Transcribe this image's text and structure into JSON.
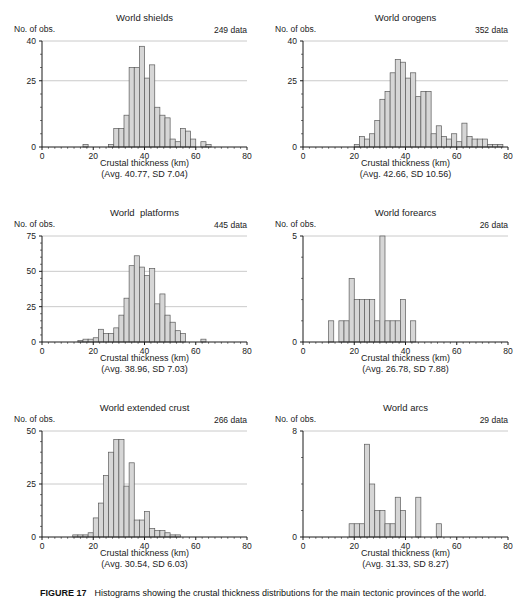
{
  "style": {
    "background": "#ffffff",
    "bar_fill": "#d6d6d6",
    "bar_stroke": "#5a5a5a",
    "grid_color": "#bdbdbd",
    "axis_color": "#1a1a1a",
    "text_color": "#222222"
  },
  "figure": {
    "caption_label": "FIGURE 17",
    "caption_text": "Histograms showing the crustal thickness distributions for the main tectonic provinces of the world."
  },
  "chart_data": [
    {
      "type": "bar",
      "title": "World shields",
      "data_count_label": "249 data",
      "ylabel": "No. of obs.",
      "xlabel": "Crustal thickness (km)",
      "stats_label": "(Avg. 40.77, SD 7.04)",
      "xlim": [
        0,
        80
      ],
      "xticks": [
        0,
        20,
        40,
        60,
        80
      ],
      "x_minor_step": 2.5,
      "ylim": [
        0,
        40
      ],
      "yticks": [
        0,
        25,
        40
      ],
      "y_minor_step": 5,
      "grid": true,
      "bin_width": 2,
      "bars": [
        {
          "start": 16,
          "count": 1
        },
        {
          "start": 26,
          "count": 1
        },
        {
          "start": 28,
          "count": 7
        },
        {
          "start": 30,
          "count": 7
        },
        {
          "start": 32,
          "count": 12
        },
        {
          "start": 34,
          "count": 30
        },
        {
          "start": 36,
          "count": 30
        },
        {
          "start": 38,
          "count": 38
        },
        {
          "start": 40,
          "count": 26
        },
        {
          "start": 42,
          "count": 31
        },
        {
          "start": 44,
          "count": 15
        },
        {
          "start": 46,
          "count": 12
        },
        {
          "start": 48,
          "count": 11
        },
        {
          "start": 50,
          "count": 3
        },
        {
          "start": 52,
          "count": 2
        },
        {
          "start": 54,
          "count": 7
        },
        {
          "start": 56,
          "count": 6
        },
        {
          "start": 58,
          "count": 3
        },
        {
          "start": 62,
          "count": 2
        },
        {
          "start": 64,
          "count": 1
        }
      ]
    },
    {
      "type": "bar",
      "title": "World orogens",
      "data_count_label": "352 data",
      "ylabel": "No. of obs.",
      "xlabel": "Crustal thickness (km)",
      "stats_label": "(Avg. 42.66, SD 10.56)",
      "xlim": [
        0,
        80
      ],
      "xticks": [
        0,
        20,
        40,
        60,
        80
      ],
      "x_minor_step": 2.5,
      "ylim": [
        0,
        40
      ],
      "yticks": [
        0,
        25,
        40
      ],
      "y_minor_step": 5,
      "grid": true,
      "bin_width": 2,
      "bars": [
        {
          "start": 20,
          "count": 1
        },
        {
          "start": 22,
          "count": 4
        },
        {
          "start": 24,
          "count": 3
        },
        {
          "start": 26,
          "count": 5
        },
        {
          "start": 28,
          "count": 10
        },
        {
          "start": 30,
          "count": 18
        },
        {
          "start": 32,
          "count": 21
        },
        {
          "start": 34,
          "count": 28
        },
        {
          "start": 36,
          "count": 33
        },
        {
          "start": 38,
          "count": 32
        },
        {
          "start": 40,
          "count": 26
        },
        {
          "start": 42,
          "count": 28
        },
        {
          "start": 44,
          "count": 19
        },
        {
          "start": 46,
          "count": 21
        },
        {
          "start": 48,
          "count": 21
        },
        {
          "start": 50,
          "count": 5
        },
        {
          "start": 52,
          "count": 8
        },
        {
          "start": 54,
          "count": 4
        },
        {
          "start": 56,
          "count": 3
        },
        {
          "start": 58,
          "count": 5
        },
        {
          "start": 60,
          "count": 2
        },
        {
          "start": 62,
          "count": 9
        },
        {
          "start": 64,
          "count": 4
        },
        {
          "start": 66,
          "count": 3
        },
        {
          "start": 68,
          "count": 3
        },
        {
          "start": 70,
          "count": 3
        },
        {
          "start": 72,
          "count": 1
        },
        {
          "start": 74,
          "count": 1
        },
        {
          "start": 76,
          "count": 1
        }
      ]
    },
    {
      "type": "bar",
      "title": "World  platforms",
      "data_count_label": "445 data",
      "ylabel": "No. of obs.",
      "xlabel": "Crustal thickness (km)",
      "stats_label": "(Avg. 38.96, SD 7.03)",
      "xlim": [
        0,
        80
      ],
      "xticks": [
        0,
        20,
        40,
        60,
        80
      ],
      "x_minor_step": 2.5,
      "ylim": [
        0,
        75
      ],
      "yticks": [
        0,
        25,
        50,
        75
      ],
      "y_minor_step": 5,
      "grid": true,
      "bin_width": 2,
      "bars": [
        {
          "start": 14,
          "count": 1
        },
        {
          "start": 16,
          "count": 2
        },
        {
          "start": 18,
          "count": 2
        },
        {
          "start": 20,
          "count": 3
        },
        {
          "start": 22,
          "count": 9
        },
        {
          "start": 24,
          "count": 6
        },
        {
          "start": 26,
          "count": 6
        },
        {
          "start": 28,
          "count": 10
        },
        {
          "start": 30,
          "count": 19
        },
        {
          "start": 32,
          "count": 31
        },
        {
          "start": 34,
          "count": 54
        },
        {
          "start": 36,
          "count": 61
        },
        {
          "start": 38,
          "count": 53
        },
        {
          "start": 40,
          "count": 47
        },
        {
          "start": 42,
          "count": 52
        },
        {
          "start": 44,
          "count": 27
        },
        {
          "start": 46,
          "count": 34
        },
        {
          "start": 48,
          "count": 19
        },
        {
          "start": 50,
          "count": 14
        },
        {
          "start": 52,
          "count": 8
        },
        {
          "start": 54,
          "count": 6
        },
        {
          "start": 62,
          "count": 2
        }
      ]
    },
    {
      "type": "bar",
      "title": "World forearcs",
      "data_count_label": "26 data",
      "ylabel": "No. of obs.",
      "xlabel": "Crustal thickness (km)",
      "stats_label": "(Avg. 26.78, SD 7.88)",
      "xlim": [
        0,
        80
      ],
      "xticks": [
        0,
        20,
        40,
        60,
        80
      ],
      "x_minor_step": 2.5,
      "ylim": [
        0,
        5
      ],
      "yticks": [
        0,
        5
      ],
      "y_minor_step": 1,
      "grid": true,
      "bin_width": 2,
      "bars": [
        {
          "start": 10,
          "count": 1
        },
        {
          "start": 14,
          "count": 1
        },
        {
          "start": 16,
          "count": 1
        },
        {
          "start": 18,
          "count": 3
        },
        {
          "start": 20,
          "count": 2
        },
        {
          "start": 22,
          "count": 2
        },
        {
          "start": 24,
          "count": 2
        },
        {
          "start": 26,
          "count": 2
        },
        {
          "start": 28,
          "count": 1
        },
        {
          "start": 30,
          "count": 5
        },
        {
          "start": 32,
          "count": 1
        },
        {
          "start": 34,
          "count": 1
        },
        {
          "start": 36,
          "count": 1
        },
        {
          "start": 38,
          "count": 2
        },
        {
          "start": 42,
          "count": 1
        }
      ]
    },
    {
      "type": "bar",
      "title": "World extended crust",
      "data_count_label": "266 data",
      "ylabel": "No. of obs.",
      "xlabel": "Crustal thickness (km)",
      "stats_label": "(Avg. 30.54, SD 6.03)",
      "xlim": [
        0,
        80
      ],
      "xticks": [
        0,
        20,
        40,
        60,
        80
      ],
      "x_minor_step": 2.5,
      "ylim": [
        0,
        50
      ],
      "yticks": [
        0,
        25,
        50
      ],
      "y_minor_step": 5,
      "grid": true,
      "bin_width": 2,
      "bars": [
        {
          "start": 12,
          "count": 1
        },
        {
          "start": 14,
          "count": 1
        },
        {
          "start": 16,
          "count": 1
        },
        {
          "start": 18,
          "count": 2
        },
        {
          "start": 20,
          "count": 9
        },
        {
          "start": 22,
          "count": 16
        },
        {
          "start": 24,
          "count": 29
        },
        {
          "start": 26,
          "count": 40
        },
        {
          "start": 28,
          "count": 46
        },
        {
          "start": 30,
          "count": 46
        },
        {
          "start": 32,
          "count": 24
        },
        {
          "start": 34,
          "count": 35
        },
        {
          "start": 36,
          "count": 8
        },
        {
          "start": 38,
          "count": 8
        },
        {
          "start": 40,
          "count": 12
        },
        {
          "start": 42,
          "count": 4
        },
        {
          "start": 44,
          "count": 3
        },
        {
          "start": 46,
          "count": 3
        },
        {
          "start": 48,
          "count": 2
        },
        {
          "start": 50,
          "count": 1
        },
        {
          "start": 52,
          "count": 1
        }
      ]
    },
    {
      "type": "bar",
      "title": "World arcs",
      "data_count_label": "29 data",
      "ylabel": "No. of obs.",
      "xlabel": "Crustal thickness (km)",
      "stats_label": "(Avg. 31.33, SD 8.27)",
      "xlim": [
        0,
        80
      ],
      "xticks": [
        0,
        20,
        40,
        60,
        80
      ],
      "x_minor_step": 2.5,
      "ylim": [
        0,
        8
      ],
      "yticks": [
        0,
        8
      ],
      "y_minor_step": 2,
      "grid": true,
      "bin_width": 2,
      "bars": [
        {
          "start": 18,
          "count": 1
        },
        {
          "start": 20,
          "count": 1
        },
        {
          "start": 22,
          "count": 1
        },
        {
          "start": 24,
          "count": 7
        },
        {
          "start": 26,
          "count": 4
        },
        {
          "start": 28,
          "count": 2
        },
        {
          "start": 30,
          "count": 2
        },
        {
          "start": 32,
          "count": 1
        },
        {
          "start": 34,
          "count": 1
        },
        {
          "start": 36,
          "count": 3
        },
        {
          "start": 38,
          "count": 2
        },
        {
          "start": 44,
          "count": 3
        },
        {
          "start": 52,
          "count": 1
        }
      ]
    }
  ]
}
